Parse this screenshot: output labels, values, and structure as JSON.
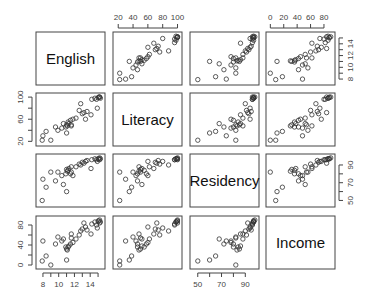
{
  "chart_data": {
    "type": "scatter",
    "title": "",
    "subtitle": "",
    "layout": "pairs (scatterplot matrix), 4x4, variable names on diagonal, no grid, no legend",
    "variables": [
      "English",
      "Literacy",
      "Residency",
      "Income"
    ],
    "axes": {
      "English": {
        "range": [
          7.5,
          15.5
        ],
        "ticks": [
          8,
          9,
          10,
          11,
          12,
          13,
          14,
          15
        ],
        "labels": [
          8,
          10,
          12,
          14
        ],
        "label_side": "bottom col1 / right row1"
      },
      "Literacy": {
        "range": [
          17,
          102
        ],
        "ticks": [
          20,
          40,
          60,
          80,
          100
        ],
        "labels_top": [
          20,
          40,
          60,
          80,
          100
        ],
        "labels_left": [
          20,
          60,
          100
        ],
        "label_side": "top col2 / left row2"
      },
      "Residency": {
        "range": [
          46,
          99
        ],
        "ticks": [
          50,
          60,
          70,
          80,
          90
        ],
        "labels": [
          50,
          70,
          90
        ],
        "label_side": "bottom col3 / right row3"
      },
      "Income": {
        "range": [
          -2,
          92
        ],
        "ticks": [
          0,
          20,
          40,
          60,
          80
        ],
        "labels_top": [
          0,
          20,
          40,
          60,
          80
        ],
        "labels_left": [
          0,
          40,
          80
        ],
        "label_side": "top col4 / left row4"
      }
    },
    "observations": {
      "English": [
        7.9,
        8.4,
        8.0,
        9.0,
        9.6,
        9.9,
        10.4,
        10.6,
        10.9,
        11.0,
        11.1,
        11.2,
        11.3,
        11.5,
        11.6,
        11.8,
        11.0,
        11.6,
        12.2,
        12.6,
        12.8,
        13.0,
        13.2,
        13.4,
        13.6,
        14.2,
        14.6,
        14.8,
        15.0,
        15.1,
        15.2,
        15.3,
        15.2,
        14.9,
        14.1
      ],
      "Literacy": [
        22,
        38,
        30,
        22,
        46,
        40,
        44,
        52,
        46,
        50,
        48,
        55,
        52,
        58,
        50,
        60,
        35,
        48,
        62,
        76,
        88,
        70,
        72,
        60,
        74,
        96,
        98,
        96,
        99,
        100,
        100,
        98,
        100,
        80,
        68
      ],
      "Residency": [
        50,
        65,
        74,
        82,
        72,
        82,
        78,
        68,
        80,
        85,
        83,
        84,
        86,
        80,
        82,
        78,
        60,
        88,
        88,
        91,
        90,
        93,
        92,
        94,
        95,
        96,
        97,
        96,
        97,
        97,
        96,
        97,
        98,
        94,
        86
      ],
      "Income": [
        8,
        18,
        48,
        0,
        42,
        56,
        48,
        52,
        36,
        32,
        30,
        36,
        38,
        42,
        54,
        45,
        10,
        62,
        52,
        60,
        68,
        72,
        84,
        76,
        70,
        82,
        86,
        80,
        88,
        88,
        84,
        86,
        90,
        74,
        62
      ]
    }
  }
}
